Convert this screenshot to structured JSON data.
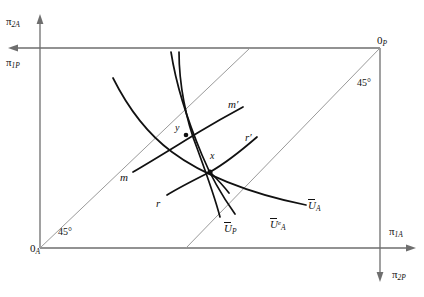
{
  "figure": {
    "type": "edgeworth-box-diagram",
    "title": "",
    "background": "#ffffff",
    "axis_color": "#6e6e6e",
    "curve_color": "#111111",
    "diagonal_color": "#9a9a9a",
    "width": 424,
    "height": 297
  },
  "origins": {
    "agent": {
      "label_main": "0",
      "label_sub": "A",
      "x": 40,
      "y": 248
    },
    "principal": {
      "label_main": "0",
      "label_sub": "P",
      "x": 380,
      "y": 45
    }
  },
  "axes": [
    {
      "name": "pi-2A",
      "main": "π",
      "sub": "2A",
      "x": 8,
      "y": 20
    },
    {
      "name": "pi-1P",
      "main": "π",
      "sub": "1P",
      "x": 6,
      "y": 58
    },
    {
      "name": "pi-1A",
      "main": "π",
      "sub": "1A",
      "x": 390,
      "y": 228
    },
    {
      "name": "pi-2P",
      "main": "π",
      "sub": "2P",
      "x": 394,
      "y": 272
    }
  ],
  "angles": [
    {
      "name": "angle-lower-left",
      "text": "45°",
      "x": 58,
      "y": 228
    },
    {
      "name": "angle-upper-right",
      "text": "45°",
      "x": 358,
      "y": 80
    }
  ],
  "points": [
    {
      "name": "point-x",
      "label": "x",
      "label_x": 211,
      "label_y": 152,
      "px": 210,
      "py": 172
    },
    {
      "name": "point-y",
      "label": "y",
      "label_x": 176,
      "label_y": 124,
      "px": 186,
      "py": 135
    }
  ],
  "curve_labels": [
    {
      "name": "curve-label-m",
      "main": "m",
      "prime": "",
      "bar": false,
      "sup": "",
      "sub": "",
      "x": 122,
      "y": 173
    },
    {
      "name": "curve-label-m-prime",
      "main": "m",
      "prime": "′",
      "bar": false,
      "sup": "",
      "sub": "",
      "x": 229,
      "y": 100
    },
    {
      "name": "curve-label-r",
      "main": "r",
      "prime": "",
      "bar": false,
      "sup": "",
      "sub": "",
      "x": 157,
      "y": 199
    },
    {
      "name": "curve-label-r-prime",
      "main": "r",
      "prime": "′",
      "bar": false,
      "sup": "",
      "sub": "",
      "x": 246,
      "y": 133
    },
    {
      "name": "curve-label-u-p",
      "main": "U",
      "prime": "",
      "bar": true,
      "sup": "",
      "sub": "P",
      "x": 226,
      "y": 224
    },
    {
      "name": "curve-label-u-a-e",
      "main": "U",
      "prime": "",
      "bar": true,
      "sup": "e",
      "sub": "A",
      "x": 272,
      "y": 220
    },
    {
      "name": "curve-label-u-a",
      "main": "U",
      "prime": "",
      "bar": true,
      "sup": "",
      "sub": "A",
      "x": 310,
      "y": 201
    }
  ],
  "geometry": {
    "box": {
      "left": 40,
      "top": 48,
      "right": 380,
      "bottom": 248
    },
    "diagonals": [
      {
        "name": "diagonal-lower-left",
        "x1": 40,
        "y1": 248,
        "x2": 250,
        "y2": 48
      },
      {
        "name": "diagonal-upper-right",
        "x1": 186,
        "y1": 248,
        "x2": 380,
        "y2": 48
      }
    ],
    "curves": [
      {
        "name": "curve-u-a",
        "d": "M113,78 C128,108 150,140 180,160 C210,180 252,196 308,206"
      },
      {
        "name": "curve-u-a-e",
        "d": "M171,52 C178,86 190,126 203,158 C212,180 224,200 234,214"
      },
      {
        "name": "curve-u-p",
        "d": "M178,52 C180,86 188,122 199,150 C206,168 214,192 219,216"
      },
      {
        "name": "curve-m",
        "d": "M132,173 C155,160 186,141 213,124 C225,117 235,112 243,108"
      },
      {
        "name": "curve-r",
        "d": "M166,196 C178,189 192,181 206,174 C224,165 240,152 257,138"
      },
      {
        "name": "curve-m-left-tail",
        "d": "M210,172 C216,176 226,183 236,192"
      }
    ]
  }
}
